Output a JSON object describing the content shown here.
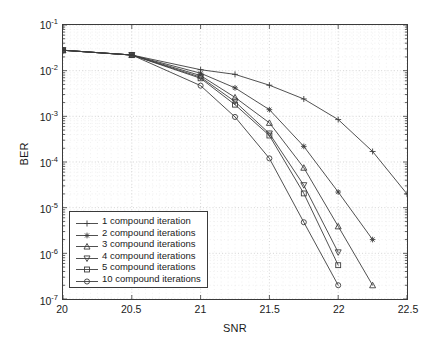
{
  "chart_data": {
    "type": "line",
    "title": "",
    "xlabel": "SNR",
    "ylabel": "BER",
    "xlim": [
      20,
      22.5
    ],
    "ylim": [
      1e-07,
      0.1
    ],
    "yscale": "log",
    "grid": true,
    "legend_position": "lower left",
    "xticks": [
      "20",
      "20.5",
      "21",
      "21.5",
      "22",
      "22.5"
    ],
    "xtick_values": [
      20,
      20.5,
      21,
      21.5,
      22,
      22.5
    ],
    "yticks": [
      "10-1",
      "10-2",
      "10-3",
      "10-4",
      "10-5",
      "10-6",
      "10-7"
    ],
    "ytick_values": [
      0.1,
      0.01,
      0.001,
      0.0001,
      1e-05,
      1e-06,
      1e-07
    ],
    "ytick_exponents": [
      -1,
      -2,
      -3,
      -4,
      -5,
      -6,
      -7
    ],
    "series": [
      {
        "name": "1 compound iteration",
        "marker": "plus",
        "x": [
          20,
          20.5,
          21,
          21.25,
          21.5,
          21.75,
          22,
          22.25,
          22.5
        ],
        "y": [
          0.028,
          0.022,
          0.0105,
          0.0083,
          0.0048,
          0.0024,
          0.00085,
          0.00017,
          2e-05
        ]
      },
      {
        "name": "2 compound iterations",
        "marker": "star",
        "x": [
          20,
          20.5,
          21,
          21.25,
          21.5,
          21.75,
          22,
          22.25
        ],
        "y": [
          0.028,
          0.022,
          0.0088,
          0.0042,
          0.0014,
          0.00022,
          2.2e-05,
          2e-06
        ]
      },
      {
        "name": "3 compound iterations",
        "marker": "triangle-up",
        "x": [
          20,
          20.5,
          21,
          21.25,
          21.5,
          21.75,
          22,
          22.25
        ],
        "y": [
          0.028,
          0.022,
          0.0078,
          0.0026,
          0.00072,
          7.5e-05,
          3.9e-06,
          2e-07
        ]
      },
      {
        "name": "4 compound iterations",
        "marker": "triangle-down",
        "x": [
          20,
          20.5,
          21,
          21.25,
          21.5,
          21.75,
          22
        ],
        "y": [
          0.028,
          0.022,
          0.0072,
          0.0021,
          0.00042,
          3.1e-05,
          1.05e-06
        ]
      },
      {
        "name": "5 compound iterations",
        "marker": "square",
        "x": [
          20,
          20.5,
          21,
          21.25,
          21.5,
          21.75,
          22
        ],
        "y": [
          0.028,
          0.022,
          0.0068,
          0.0018,
          0.00038,
          2.05e-05,
          5.5e-07
        ]
      },
      {
        "name": "10 compound iterations",
        "marker": "circle",
        "x": [
          20,
          20.5,
          21,
          21.25,
          21.5,
          21.75,
          22
        ],
        "y": [
          0.028,
          0.022,
          0.0047,
          0.00097,
          0.00012,
          4.8e-06,
          2e-07
        ]
      }
    ]
  },
  "axes": {
    "xlabel": "SNR",
    "ylabel": "BER"
  }
}
